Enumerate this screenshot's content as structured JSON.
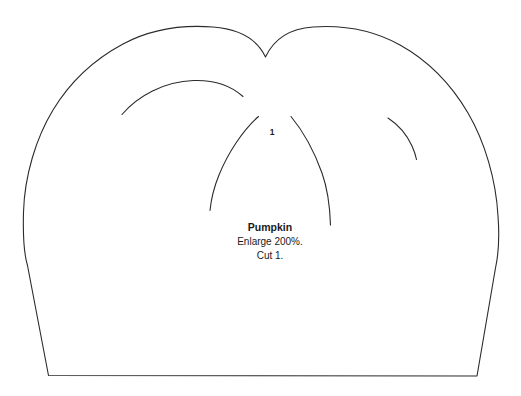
{
  "page": {
    "title": "Pumpkin",
    "background_color": "#ffffff",
    "line_color": "#2b2b2b",
    "text_color": "#1a1a1a",
    "width": 521,
    "height": 396
  },
  "pattern": {
    "piece_number": "1",
    "label": {
      "title": "Pumpkin",
      "instruction_1": "Enlarge 200%.",
      "instruction_2": "Cut 1."
    },
    "shape_name": "pumpkin-body-outline",
    "detail_lines": [
      "upper-left-rind-arc",
      "center-left-rib",
      "center-right-rib",
      "upper-right-rind-arc"
    ]
  }
}
